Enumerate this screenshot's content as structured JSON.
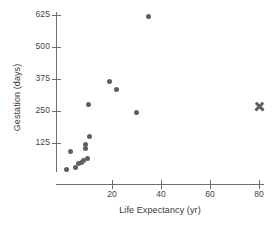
{
  "chart_data": {
    "type": "scatter",
    "title": "",
    "xlabel": "Life Expectancy (yr)",
    "ylabel": "Gestation (days)",
    "xlim": [
      0,
      85
    ],
    "ylim": [
      0,
      660
    ],
    "grid": false,
    "legend": "none",
    "xticks": [
      20,
      40,
      60,
      80
    ],
    "yticks": [
      125,
      250,
      375,
      500,
      625
    ],
    "xtick_labels": [
      "20",
      "40",
      "60",
      "80"
    ],
    "ytick_labels": [
      "125",
      "250",
      "375",
      "500",
      "625"
    ],
    "series": [
      {
        "name": "animals",
        "marker": "circle",
        "color": "#5f5f5f",
        "points": [
          {
            "x": 1.5,
            "y": 20
          },
          {
            "x": 3.0,
            "y": 90
          },
          {
            "x": 5.0,
            "y": 30
          },
          {
            "x": 6.5,
            "y": 45
          },
          {
            "x": 7.5,
            "y": 50
          },
          {
            "x": 8.5,
            "y": 55
          },
          {
            "x": 9.0,
            "y": 105
          },
          {
            "x": 9.2,
            "y": 120
          },
          {
            "x": 10.0,
            "y": 63
          },
          {
            "x": 11.0,
            "y": 150
          },
          {
            "x": 10.5,
            "y": 275
          },
          {
            "x": 19.0,
            "y": 365
          },
          {
            "x": 22.0,
            "y": 335
          },
          {
            "x": 30.0,
            "y": 243
          },
          {
            "x": 35.0,
            "y": 620
          }
        ]
      },
      {
        "name": "human",
        "marker": "x",
        "color": "#5f5f5f",
        "points": [
          {
            "x": 80.0,
            "y": 266
          }
        ]
      }
    ]
  },
  "axes": {
    "x_title": "Life Expectancy (yr)",
    "y_title": "Gestation (days)"
  }
}
